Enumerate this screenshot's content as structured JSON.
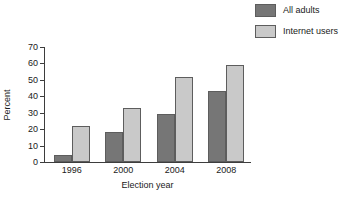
{
  "chart_data": {
    "type": "bar",
    "title": "",
    "subtitle": "",
    "xlabel": "Election year",
    "ylabel": "Percent",
    "categories": [
      "1996",
      "2000",
      "2004",
      "2008"
    ],
    "series": [
      {
        "name": "All adults",
        "color": "#767676",
        "values": [
          4,
          18,
          29,
          43
        ]
      },
      {
        "name": "Internet users",
        "color": "#c9c9c9",
        "values": [
          22,
          33,
          52,
          59
        ]
      }
    ],
    "ylim": [
      0,
      70
    ],
    "yticks": [
      0,
      10,
      20,
      30,
      40,
      50,
      60,
      70
    ],
    "ytick_labels": [
      "0",
      "10",
      "20",
      "30",
      "40",
      "50",
      "60",
      "70"
    ],
    "grid": false,
    "legend_position": "top-right",
    "annotations": []
  },
  "legend": {
    "items": [
      {
        "label": "All adults",
        "swatch_name": "legend-swatch-all-adults"
      },
      {
        "label": "Internet users",
        "swatch_name": "legend-swatch-internet-users"
      }
    ]
  }
}
